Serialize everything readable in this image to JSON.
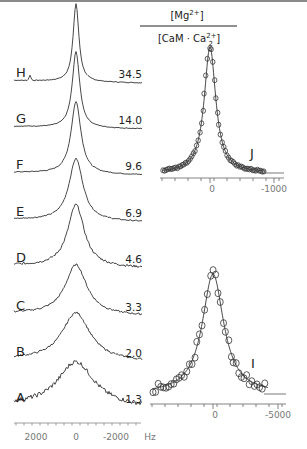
{
  "header": {
    "numerator": "[Mg2+]",
    "denominator": "[CaM·Ca22+]"
  },
  "spectra": [
    {
      "label": "H",
      "ratio": "34.5"
    },
    {
      "label": "G",
      "ratio": "14.0"
    },
    {
      "label": "F",
      "ratio": "9.6"
    },
    {
      "label": "E",
      "ratio": "6.9"
    },
    {
      "label": "D",
      "ratio": "4.6"
    },
    {
      "label": "C",
      "ratio": "3.3"
    },
    {
      "label": "B",
      "ratio": "2.0"
    },
    {
      "label": "A",
      "ratio": "1.3"
    }
  ],
  "left_axis": {
    "ticks": [
      "2000",
      "0",
      "-2000"
    ],
    "unit": "Hz"
  },
  "panel_j": {
    "label": "J",
    "ticks": [
      "0",
      "-1000"
    ]
  },
  "panel_i": {
    "label": "I",
    "ticks": [
      "0",
      "-5000"
    ]
  },
  "chart_data": [
    {
      "type": "line",
      "title": "25Mg NMR spectra at increasing [Mg2+]/[CaM·Ca2 2+]",
      "xlabel": "Hz",
      "ylabel": "",
      "xlim": [
        3000,
        -3000
      ],
      "x_ticks": [
        2000,
        0,
        -2000
      ],
      "series": [
        {
          "name": "A",
          "ratio": 1.3,
          "linewidth_hz_approx": 1400
        },
        {
          "name": "B",
          "ratio": 2.0,
          "linewidth_hz_approx": 1100
        },
        {
          "name": "C",
          "ratio": 3.3,
          "linewidth_hz_approx": 800
        },
        {
          "name": "D",
          "ratio": 4.6,
          "linewidth_hz_approx": 650
        },
        {
          "name": "E",
          "ratio": 6.9,
          "linewidth_hz_approx": 450
        },
        {
          "name": "F",
          "ratio": 9.6,
          "linewidth_hz_approx": 350
        },
        {
          "name": "G",
          "ratio": 14.0,
          "linewidth_hz_approx": 250
        },
        {
          "name": "H",
          "ratio": 34.5,
          "linewidth_hz_approx": 150
        }
      ],
      "legend": "ratio labels at right of each trace",
      "grid": false
    },
    {
      "type": "scatter",
      "title": "J",
      "xlabel": "Hz",
      "x_ticks": [
        0,
        -1000
      ],
      "xlim": [
        1100,
        -1200
      ],
      "note": "Expanded spectrum H with Lorentzian fit (line) over data points (circles)"
    },
    {
      "type": "scatter",
      "title": "I",
      "xlabel": "Hz",
      "x_ticks": [
        0,
        -5000
      ],
      "xlim": [
        5500,
        -6000
      ],
      "note": "Expanded spectrum A with Lorentzian fit (line) over data points (circles)"
    }
  ]
}
